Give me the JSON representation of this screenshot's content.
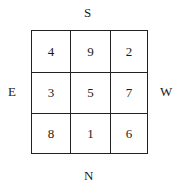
{
  "directions": {
    "top": "S",
    "bottom": "N",
    "left": "E",
    "right": "W"
  },
  "grid": [
    [
      "4",
      "9",
      "2"
    ],
    [
      "3",
      "5",
      "7"
    ],
    [
      "8",
      "1",
      "6"
    ]
  ]
}
